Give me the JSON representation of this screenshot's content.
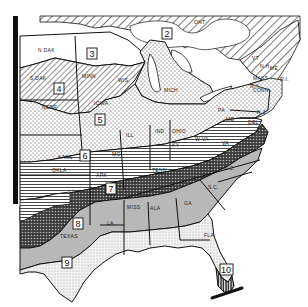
{
  "map": {
    "title": "",
    "region": "Eastern United States",
    "zones": [
      {
        "id": "2",
        "label": "2",
        "pattern": "diagonal-hatch-wide"
      },
      {
        "id": "3",
        "label": "3",
        "pattern": "blank"
      },
      {
        "id": "4",
        "label": "4",
        "pattern": "diagonal-hatch"
      },
      {
        "id": "5",
        "label": "5",
        "pattern": "dots"
      },
      {
        "id": "6",
        "label": "6",
        "pattern": "horizontal-lines"
      },
      {
        "id": "7",
        "label": "7",
        "pattern": "dense-crosshatch"
      },
      {
        "id": "8",
        "label": "8",
        "pattern": "gray-solid"
      },
      {
        "id": "9",
        "label": "9",
        "pattern": "fine-dots"
      },
      {
        "id": "10",
        "label": "10",
        "pattern": "vertical-dark-hatch"
      }
    ],
    "state_labels": {
      "ont": "ONT",
      "ndak": "N DAK",
      "sdak": "S DAK",
      "minn": "MINN",
      "wis": "WIS",
      "mich": "MICH",
      "nebr": "NEBR",
      "iowa": "IOWA",
      "ill": "ILL",
      "ind": "IND",
      "ohio": "OHIO",
      "pa": "PA",
      "ny": "N.Y.",
      "me": "ME",
      "vt": "VT",
      "nh": "N.H.",
      "mass": "MASS",
      "ri": "R.I.",
      "conn": "CONN",
      "nj": "N.J.",
      "del": "DEL",
      "md": "MD",
      "wva": "W VA",
      "va": "VA",
      "ky": "KY",
      "kans": "KANS",
      "mo": "MO",
      "okla": "OKLA",
      "ark": "ARK",
      "tenn": "TENN",
      "nc": "N.C.",
      "sc": "S.C.",
      "ga": "GA",
      "ala": "ALA",
      "miss": "MISS",
      "la": "LA",
      "texas": "TEXAS",
      "fla": "FLA"
    }
  }
}
